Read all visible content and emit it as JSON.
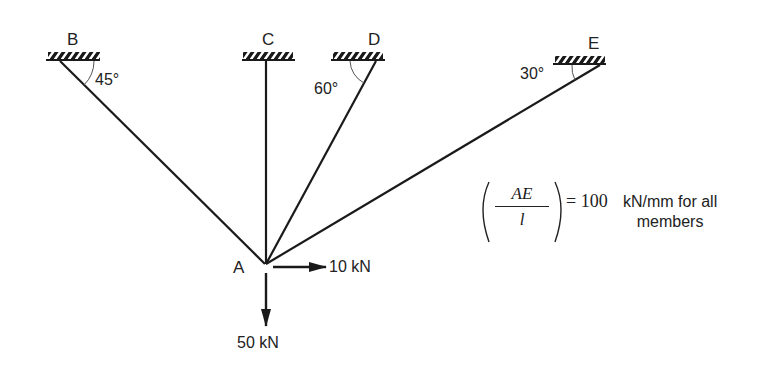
{
  "diagram": {
    "type": "truss-support-diagram",
    "supports": [
      {
        "id": "B",
        "label": "B",
        "angle_label": "45°"
      },
      {
        "id": "C",
        "label": "C",
        "angle_label": ""
      },
      {
        "id": "D",
        "label": "D",
        "angle_label": "60°"
      },
      {
        "id": "E",
        "label": "E",
        "angle_label": "30°"
      }
    ],
    "joint": {
      "label": "A"
    },
    "loads": [
      {
        "label": "10 kN",
        "direction": "right"
      },
      {
        "label": "50 kN",
        "direction": "down"
      }
    ],
    "note": {
      "fraction_numerator": "AE",
      "fraction_denominator": "l",
      "equals": "= 100",
      "text_line1": "kN/mm for all",
      "text_line2": "members"
    },
    "colors": {
      "line": "#1a1a1a",
      "background": "#ffffff"
    }
  }
}
